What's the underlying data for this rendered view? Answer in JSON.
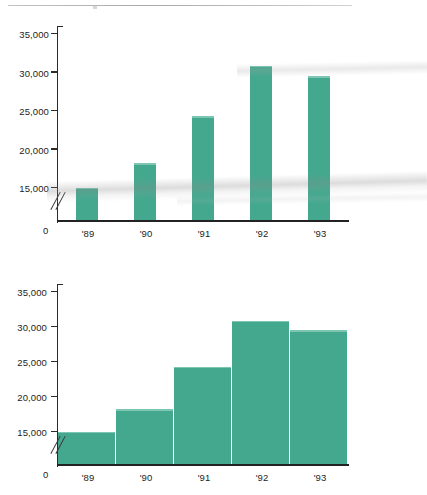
{
  "page": {
    "background": "#ffffff",
    "rule_color": "#a8a8a8"
  },
  "chart_data": [
    {
      "id": "upper",
      "type": "bar",
      "title": "",
      "subtitle": "",
      "xlabel": "",
      "ylabel": "",
      "categories": [
        "'89",
        "'90",
        "'91",
        "'92",
        "'93"
      ],
      "values": [
        14500,
        18000,
        24100,
        30700,
        29300
      ],
      "ylim": [
        0,
        35000
      ],
      "yticks": [
        15000,
        20000,
        25000,
        30000,
        35000
      ],
      "ytick_labels": [
        "15,000",
        "20,000",
        "25,000",
        "30,000",
        "35,000"
      ],
      "zero_label": "0",
      "axis_break": true,
      "axis_break_symbol": "//",
      "grid": false,
      "legend": "none",
      "bar_style": "narrow-separated",
      "bar_color": "#43a88e",
      "axis_color": "#2b2b2b"
    },
    {
      "id": "lower",
      "type": "bar",
      "title": "",
      "subtitle": "",
      "xlabel": "",
      "ylabel": "",
      "categories": [
        "'89",
        "'90",
        "'91",
        "'92",
        "'93"
      ],
      "values": [
        14500,
        18000,
        24100,
        30700,
        29300
      ],
      "ylim": [
        0,
        35000
      ],
      "yticks": [
        15000,
        20000,
        25000,
        30000,
        35000
      ],
      "ytick_labels": [
        "15,000",
        "20,000",
        "25,000",
        "30,000",
        "35,000"
      ],
      "zero_label": "0",
      "axis_break": true,
      "axis_break_symbol": "//",
      "grid": false,
      "legend": "none",
      "bar_style": "wide-adjacent",
      "bar_color": "#43a88e",
      "axis_color": "#2b2b2b"
    }
  ]
}
